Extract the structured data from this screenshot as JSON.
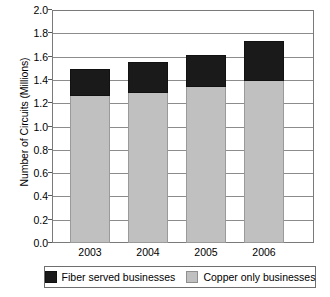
{
  "chart_data": {
    "type": "bar",
    "stacked": true,
    "title": "",
    "xlabel": "",
    "ylabel": "Number of Circuits (Millions)",
    "categories": [
      "2003",
      "2004",
      "2005",
      "2006"
    ],
    "ylim": [
      0.0,
      2.0
    ],
    "ytick_step": 0.2,
    "ytick_labels": [
      "2.0",
      "1.8",
      "1.6",
      "1.4",
      "1.2",
      "1.0",
      "0.8",
      "0.6",
      "0.4",
      "0.2",
      "0.0"
    ],
    "grid": true,
    "legend_position": "bottom",
    "series": [
      {
        "name": "Copper only businesses",
        "color": "#c0c0c0",
        "values": [
          1.27,
          1.3,
          1.35,
          1.4
        ]
      },
      {
        "name": "Fiber served businesses",
        "color": "#1a1a1a",
        "values": [
          0.23,
          0.26,
          0.27,
          0.34
        ]
      }
    ],
    "totals": [
      1.5,
      1.56,
      1.62,
      1.74
    ]
  },
  "legend": {
    "items": [
      {
        "label": "Fiber served businesses",
        "swatch": "black-square-icon"
      },
      {
        "label": "Copper only businesses",
        "swatch": "gray-square-icon"
      }
    ]
  }
}
